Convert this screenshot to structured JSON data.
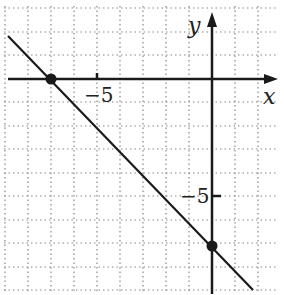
{
  "graph": {
    "x_axis_label": "x",
    "y_axis_label": "y",
    "x_tick_label": "−5",
    "y_tick_label": "−5",
    "grid_x_range": [
      -9,
      2
    ],
    "grid_y_range": [
      -9,
      3
    ],
    "line": {
      "slope": -1,
      "intercept": -7,
      "equation": "y = -x - 7"
    },
    "points": [
      {
        "name": "x-intercept",
        "x": -7,
        "y": 0
      },
      {
        "name": "y-intercept",
        "x": 0,
        "y": -7
      }
    ],
    "colors": {
      "line": "#1a1a1a",
      "grid": "#888888",
      "axes": "#1a1a1a"
    }
  }
}
